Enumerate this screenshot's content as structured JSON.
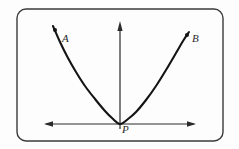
{
  "figure": {
    "type": "geometry-diagram",
    "background_color": "#fdfdfd",
    "frame": {
      "shape": "rounded-rectangle",
      "stroke_color": "#3a3a3a",
      "stroke_width": 1.4,
      "corner_radius": 9,
      "x": 17,
      "y": 9,
      "width": 206,
      "height": 132
    },
    "curve": {
      "name": "parabola",
      "stroke_color": "#141414",
      "stroke_width": 2.1,
      "vertex": {
        "x": 120,
        "y": 124
      },
      "left_endpoint": {
        "x": 53,
        "y": 26
      },
      "right_endpoint": {
        "x": 189,
        "y": 32
      }
    },
    "axes": {
      "vertical": {
        "name": "axis-of-symmetry",
        "stroke_color": "#2b2b2b",
        "stroke_width": 1.2,
        "x": 120,
        "y_bottom": 126,
        "y_top": 22,
        "arrow": "up"
      },
      "horizontal": {
        "name": "horizontal-axis",
        "stroke_color": "#2b2b2b",
        "stroke_width": 1.2,
        "y": 124,
        "x_left": 44,
        "x_right": 196,
        "arrow": "both"
      }
    },
    "points": [
      {
        "id": "A",
        "label": "A",
        "marker": {
          "x": 55,
          "y": 30,
          "radius": 2.0,
          "color": "#141414"
        },
        "label_position": {
          "x": 62,
          "y": 33
        }
      },
      {
        "id": "B",
        "label": "B",
        "marker": {
          "x": 187,
          "y": 35,
          "radius": 2.0,
          "color": "#141414"
        },
        "label_position": {
          "x": 192,
          "y": 33
        }
      },
      {
        "id": "P",
        "label": "P",
        "marker": {
          "x": 120,
          "y": 124,
          "radius": 0,
          "color": "#141414"
        },
        "label_position": {
          "x": 122,
          "y": 124
        }
      }
    ]
  },
  "chart_data": {
    "type": "line",
    "title": "",
    "xlabel": "",
    "ylabel": "",
    "grid": false,
    "legend": "none",
    "annotations": [
      {
        "text": "A",
        "x": 62,
        "y": 33
      },
      {
        "text": "B",
        "x": 192,
        "y": 33
      },
      {
        "text": "P",
        "x": 122,
        "y": 124
      }
    ],
    "series": [
      {
        "name": "parabola",
        "points": [
          {
            "x": 53,
            "y": 26
          },
          {
            "x": 60,
            "y": 42
          },
          {
            "x": 68,
            "y": 58
          },
          {
            "x": 76,
            "y": 72
          },
          {
            "x": 85,
            "y": 86
          },
          {
            "x": 95,
            "y": 99
          },
          {
            "x": 105,
            "y": 111
          },
          {
            "x": 112,
            "y": 118
          },
          {
            "x": 120,
            "y": 124
          },
          {
            "x": 128,
            "y": 119
          },
          {
            "x": 136,
            "y": 112
          },
          {
            "x": 146,
            "y": 100
          },
          {
            "x": 156,
            "y": 86
          },
          {
            "x": 166,
            "y": 70
          },
          {
            "x": 176,
            "y": 53
          },
          {
            "x": 183,
            "y": 41
          },
          {
            "x": 189,
            "y": 32
          }
        ]
      }
    ]
  }
}
